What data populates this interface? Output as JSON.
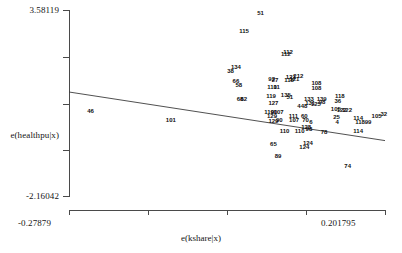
{
  "chart_data": {
    "type": "scatter",
    "title": "",
    "subtitle": "",
    "xlabel": "e(kshare|x)",
    "ylabel": "e(healthpu|x)",
    "grid": false,
    "legend": "none",
    "marker_style": "numeric-observation-labels",
    "xlim": [
      -0.27879,
      0.201795
    ],
    "ylim": [
      -2.16042,
      3.58119
    ],
    "x_tick_labels": [
      "-0.27879",
      "0.201795"
    ],
    "y_tick_labels": [
      "3.58119",
      "-2.16042"
    ],
    "y_axis_label_at_tick": "e(healthpu|x)",
    "n_x_ticks": 5,
    "n_y_ticks": 5,
    "fit_line": {
      "label": "linear fit",
      "slope_sign": "negative",
      "x_start": -0.27879,
      "y_start": 1.05,
      "x_end": 0.201795,
      "y_end": -0.45
    },
    "points": [
      {
        "label": "51",
        "x": 0.0125,
        "y": 3.5
      },
      {
        "label": "115",
        "x": -0.0125,
        "y": 2.92
      },
      {
        "label": "112",
        "x": 0.0545,
        "y": 2.3
      },
      {
        "label": "112",
        "x": 0.051,
        "y": 2.22
      },
      {
        "label": "134",
        "x": -0.025,
        "y": 1.82
      },
      {
        "label": "38",
        "x": -0.033,
        "y": 1.7
      },
      {
        "label": "66",
        "x": -0.025,
        "y": 1.38
      },
      {
        "label": "58",
        "x": -0.0205,
        "y": 1.26
      },
      {
        "label": "92",
        "x": 0.0295,
        "y": 1.46
      },
      {
        "label": "27",
        "x": 0.0345,
        "y": 1.42
      },
      {
        "label": "121",
        "x": 0.0585,
        "y": 1.5
      },
      {
        "label": "212",
        "x": 0.07,
        "y": 1.56
      },
      {
        "label": "118",
        "x": 0.056,
        "y": 1.42
      },
      {
        "label": "121",
        "x": 0.064,
        "y": 1.44
      },
      {
        "label": "110",
        "x": 0.03,
        "y": 1.22
      },
      {
        "label": "11",
        "x": 0.037,
        "y": 1.2
      },
      {
        "label": "108",
        "x": 0.0975,
        "y": 1.34
      },
      {
        "label": "108",
        "x": 0.0975,
        "y": 1.18
      },
      {
        "label": "68",
        "x": -0.0185,
        "y": 0.84
      },
      {
        "label": "62",
        "x": -0.013,
        "y": 0.84
      },
      {
        "label": "119",
        "x": 0.0285,
        "y": 0.92
      },
      {
        "label": "135",
        "x": 0.051,
        "y": 0.96
      },
      {
        "label": "51",
        "x": 0.057,
        "y": 0.9
      },
      {
        "label": "133",
        "x": 0.086,
        "y": 0.84
      },
      {
        "label": "139",
        "x": 0.1055,
        "y": 0.84
      },
      {
        "label": "127",
        "x": 0.032,
        "y": 0.72
      },
      {
        "label": "131",
        "x": 0.088,
        "y": 0.7
      },
      {
        "label": "125",
        "x": 0.0965,
        "y": 0.68
      },
      {
        "label": "98",
        "x": 0.106,
        "y": 0.74
      },
      {
        "label": "118",
        "x": 0.133,
        "y": 0.92
      },
      {
        "label": "36",
        "x": 0.13,
        "y": 0.78
      },
      {
        "label": "448",
        "x": 0.076,
        "y": 0.62
      },
      {
        "label": "119",
        "x": 0.0255,
        "y": 0.44
      },
      {
        "label": "90",
        "x": 0.033,
        "y": 0.42
      },
      {
        "label": "107",
        "x": 0.04,
        "y": 0.42
      },
      {
        "label": "105",
        "x": 0.127,
        "y": 0.52
      },
      {
        "label": "122",
        "x": 0.136,
        "y": 0.5
      },
      {
        "label": "122",
        "x": 0.144,
        "y": 0.5
      },
      {
        "label": "129",
        "x": 0.03,
        "y": 0.3
      },
      {
        "label": "111",
        "x": 0.0625,
        "y": 0.32
      },
      {
        "label": "60",
        "x": 0.079,
        "y": 0.3
      },
      {
        "label": "25",
        "x": 0.128,
        "y": 0.28
      },
      {
        "label": "114",
        "x": 0.161,
        "y": 0.26
      },
      {
        "label": "105",
        "x": 0.189,
        "y": 0.3
      },
      {
        "label": "32",
        "x": 0.2,
        "y": 0.36
      },
      {
        "label": "129",
        "x": 0.032,
        "y": 0.16
      },
      {
        "label": "90",
        "x": 0.041,
        "y": 0.18
      },
      {
        "label": "107",
        "x": 0.0635,
        "y": 0.18
      },
      {
        "label": "70",
        "x": 0.081,
        "y": 0.18
      },
      {
        "label": "6",
        "x": 0.089,
        "y": 0.12
      },
      {
        "label": "4",
        "x": 0.129,
        "y": 0.12
      },
      {
        "label": "118",
        "x": 0.164,
        "y": 0.12
      },
      {
        "label": "99",
        "x": 0.176,
        "y": 0.14
      },
      {
        "label": "128",
        "x": 0.082,
        "y": -0.04
      },
      {
        "label": "98",
        "x": 0.086,
        "y": -0.1
      },
      {
        "label": "110",
        "x": 0.049,
        "y": -0.16
      },
      {
        "label": "110",
        "x": 0.072,
        "y": -0.14
      },
      {
        "label": "78",
        "x": 0.109,
        "y": -0.18
      },
      {
        "label": "114",
        "x": 0.161,
        "y": -0.16
      },
      {
        "label": "65",
        "x": 0.032,
        "y": -0.56
      },
      {
        "label": "124",
        "x": 0.0845,
        "y": -0.52
      },
      {
        "label": "124",
        "x": 0.079,
        "y": -0.66
      },
      {
        "label": "89",
        "x": 0.039,
        "y": -0.92
      },
      {
        "label": "74",
        "x": 0.145,
        "y": -1.22
      },
      {
        "label": "46",
        "x": -0.246,
        "y": 0.46
      },
      {
        "label": "101",
        "x": -0.124,
        "y": 0.18
      }
    ]
  }
}
